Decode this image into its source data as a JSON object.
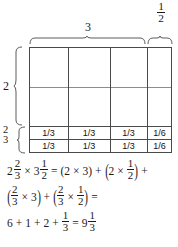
{
  "diagram": {
    "type": "area-model",
    "title_labels": {
      "top_wide": "3",
      "top_narrow_num": "1",
      "top_narrow_den": "2",
      "left_tall": "2",
      "left_short_num": "2",
      "left_short_den": "3"
    },
    "grid": {
      "columns": 4,
      "column_widths_label": [
        "1",
        "1",
        "1",
        "1/2"
      ],
      "upper_rows": 2,
      "lower_rows": 2,
      "lower_row_cells": [
        [
          "1/3",
          "1/3",
          "1/3",
          "1/6"
        ],
        [
          "1/3",
          "1/3",
          "1/3",
          "1/6"
        ]
      ]
    },
    "colors": {
      "line": "#4a4a4a",
      "line_faint": "#8d8d8d",
      "text": "#1a1a1a",
      "background": "#ffffff"
    }
  },
  "equations": {
    "line1": {
      "lhs_mixed_whole": "2",
      "lhs_mixed_num": "2",
      "lhs_mixed_den": "3",
      "times": "×",
      "rhs_mixed_whole": "3",
      "rhs_mixed_num": "1",
      "rhs_mixed_den": "2",
      "equals": "=",
      "term1_open": "(",
      "term1_a": "2",
      "term1_times": "×",
      "term1_b": "3",
      "term1_close": ")",
      "plus1": "+",
      "term2_open": "(",
      "term2_a": "2",
      "term2_times": "×",
      "term2_num": "1",
      "term2_den": "2",
      "term2_close": ")",
      "plus2": "+"
    },
    "line2": {
      "term3_open": "(",
      "term3_num": "2",
      "term3_den": "3",
      "term3_times": "×",
      "term3_b": "3",
      "term3_close": ")",
      "plus": "+",
      "term4_open": "(",
      "term4_num": "2",
      "term4_den": "3",
      "term4_times": "×",
      "term4_num2": "1",
      "term4_den2": "2",
      "term4_close": ")",
      "equals": "="
    },
    "line3": {
      "a": "6",
      "plus1": "+",
      "b": "1",
      "plus2": "+",
      "c": "2",
      "plus3": "+",
      "d_num": "1",
      "d_den": "3",
      "equals": "=",
      "result_whole": "9",
      "result_num": "1",
      "result_den": "3"
    }
  }
}
